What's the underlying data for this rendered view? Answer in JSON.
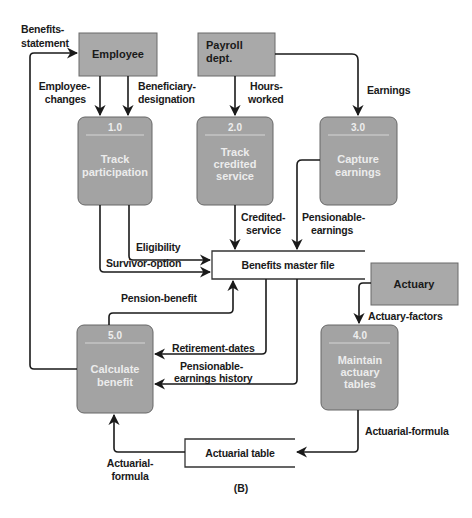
{
  "diagram": {
    "type": "data-flow-diagram",
    "caption": "(B)",
    "external_entities": {
      "employee": "Employee",
      "payroll": [
        "Payroll",
        "dept."
      ],
      "actuary": "Actuary"
    },
    "processes": [
      {
        "id": "1.0",
        "label": [
          "Track",
          "participation"
        ]
      },
      {
        "id": "2.0",
        "label": [
          "Track",
          "credited",
          "service"
        ]
      },
      {
        "id": "3.0",
        "label": [
          "Capture",
          "earnings"
        ]
      },
      {
        "id": "4.0",
        "label": [
          "Maintain",
          "actuary",
          "tables"
        ]
      },
      {
        "id": "5.0",
        "label": [
          "Calculate",
          "benefit"
        ]
      }
    ],
    "data_stores": {
      "benefits_master_file": "Benefits master file",
      "actuarial_table": "Actuarial table"
    },
    "flows": {
      "benefits_statement": [
        "Benefits-",
        "statement"
      ],
      "employee_changes": [
        "Employee-",
        "changes"
      ],
      "beneficiary_designation": [
        "Beneficiary-",
        "designation"
      ],
      "hours_worked": [
        "Hours-",
        "worked"
      ],
      "earnings": "Earnings",
      "credited_service": [
        "Credited-",
        "service"
      ],
      "pensionable_earnings": [
        "Pensionable-",
        "earnings"
      ],
      "eligibility": "Eligibility",
      "survivor_option": "Survivor-option",
      "pension_benefit": "Pension-benefit",
      "actuary_factors": "Actuary-factors",
      "retirement_dates": "Retirement-dates",
      "pensionable_earnings_history": [
        "Pensionable-",
        "earnings history"
      ],
      "actuarial_formula_out": "Actuarial-formula",
      "actuarial_formula_in": [
        "Actuarial-",
        "formula"
      ]
    }
  }
}
